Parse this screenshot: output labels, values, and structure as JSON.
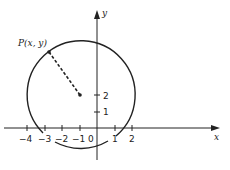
{
  "diagram": {
    "point_label": "P(x, y)",
    "x_axis_label": "x",
    "y_axis_label": "y",
    "origin_label": "0",
    "x_ticks": [
      "−4",
      "−3",
      "−2",
      "−1",
      "1",
      "2"
    ],
    "y_ticks": [
      "1",
      "2"
    ],
    "center": {
      "x": -1,
      "y": 2
    },
    "colors": {
      "stroke": "#222222",
      "background": "#ffffff"
    }
  }
}
